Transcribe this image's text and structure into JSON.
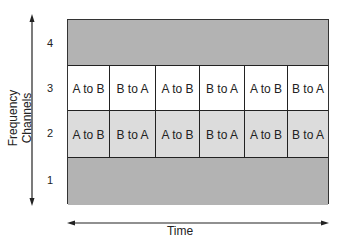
{
  "diagram": {
    "type": "fdma-tdd channel diagram",
    "y_axis_label": "Frequency Channels",
    "x_axis_label": "Time",
    "channels": [
      {
        "number": "4",
        "type": "full",
        "fill": "#b3b3b3",
        "slots": []
      },
      {
        "number": "3",
        "type": "slots",
        "fill": "#ffffff",
        "slots": [
          "A to B",
          "B to A",
          "A to B",
          "B to A",
          "A to B",
          "B to A"
        ]
      },
      {
        "number": "2",
        "type": "slots",
        "fill": "#dcdcdc",
        "slots": [
          "A to B",
          "B to A",
          "A to B",
          "B to A",
          "A to B",
          "B to A"
        ]
      },
      {
        "number": "1",
        "type": "full",
        "fill": "#b3b3b3",
        "slots": []
      }
    ]
  }
}
